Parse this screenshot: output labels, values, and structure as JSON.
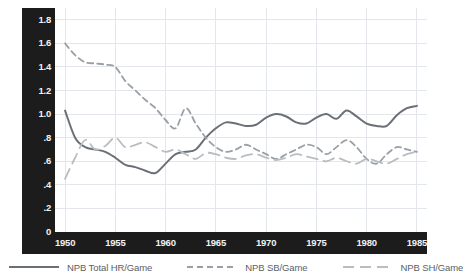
{
  "chart_data": {
    "type": "line",
    "title": "",
    "subtitle": "",
    "xlabel": "",
    "ylabel": "",
    "xlim": [
      1949,
      1986
    ],
    "ylim": [
      0,
      1.9
    ],
    "grid": true,
    "legend_position": "bottom",
    "y_ticks": [
      "1.8",
      "1.6",
      "1.4",
      "1.2",
      "1.0",
      ".8",
      ".6",
      ".4",
      ".2",
      "0"
    ],
    "y_tick_values": [
      1.8,
      1.6,
      1.4,
      1.2,
      1.0,
      0.8,
      0.6,
      0.4,
      0.2,
      0
    ],
    "x_ticks": [
      "1950",
      "1955",
      "1960",
      "1965",
      "1970",
      "1975",
      "1980",
      "1985"
    ],
    "x_tick_values": [
      1950,
      1955,
      1960,
      1965,
      1970,
      1975,
      1980,
      1985
    ],
    "x": [
      1950,
      1951,
      1952,
      1953,
      1954,
      1955,
      1956,
      1957,
      1958,
      1959,
      1960,
      1961,
      1962,
      1963,
      1964,
      1965,
      1966,
      1967,
      1968,
      1969,
      1970,
      1971,
      1972,
      1973,
      1974,
      1975,
      1976,
      1977,
      1978,
      1979,
      1980,
      1981,
      1982,
      1983,
      1984,
      1985
    ],
    "series": [
      {
        "name": "NPB Total HR/Game",
        "style": "solid",
        "color": "#6b6f76",
        "values": [
          1.03,
          0.8,
          0.72,
          0.7,
          0.68,
          0.63,
          0.57,
          0.55,
          0.52,
          0.5,
          0.58,
          0.66,
          0.68,
          0.7,
          0.8,
          0.88,
          0.93,
          0.92,
          0.9,
          0.91,
          0.97,
          1.0,
          0.98,
          0.93,
          0.92,
          0.97,
          1.0,
          0.96,
          1.03,
          0.98,
          0.92,
          0.9,
          0.9,
          0.99,
          1.05,
          1.07
        ]
      },
      {
        "name": "NPB SB/Game",
        "style": "dashed",
        "color": "#9ba0a7",
        "values": [
          1.6,
          1.5,
          1.44,
          1.43,
          1.42,
          1.4,
          1.28,
          1.2,
          1.12,
          1.05,
          0.95,
          0.88,
          1.05,
          0.92,
          0.8,
          0.72,
          0.68,
          0.7,
          0.74,
          0.7,
          0.66,
          0.62,
          0.66,
          0.7,
          0.74,
          0.72,
          0.66,
          0.72,
          0.78,
          0.72,
          0.62,
          0.58,
          0.66,
          0.72,
          0.7,
          0.68
        ]
      },
      {
        "name": "NPB SH/Game",
        "style": "longdash",
        "color": "#b9bdc3",
        "values": [
          0.45,
          0.63,
          0.78,
          0.7,
          0.73,
          0.8,
          0.72,
          0.74,
          0.76,
          0.72,
          0.68,
          0.7,
          0.66,
          0.62,
          0.67,
          0.66,
          0.63,
          0.62,
          0.65,
          0.66,
          0.63,
          0.61,
          0.63,
          0.66,
          0.64,
          0.62,
          0.6,
          0.63,
          0.6,
          0.58,
          0.62,
          0.6,
          0.58,
          0.62,
          0.66,
          0.68
        ]
      }
    ]
  },
  "legend": {
    "items": [
      {
        "label": "NPB Total HR/Game",
        "style": "solid",
        "color": "#6b6f76"
      },
      {
        "label": "NPB SB/Game",
        "style": "dashed",
        "color": "#9ba0a7"
      },
      {
        "label": "NPB SH/Game",
        "style": "longdash",
        "color": "#b9bdc3"
      }
    ]
  },
  "colors": {
    "axis_band": "#1c1c1c",
    "axis_text": "#f2f2f2",
    "grid": "#e3e6ea",
    "plot_background": "#ffffff",
    "legend_text": "#5a5f66"
  }
}
